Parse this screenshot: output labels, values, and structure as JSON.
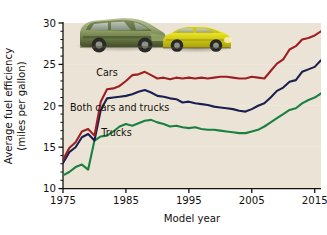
{
  "chart_data": {
    "type": "line",
    "title": "",
    "xlabel": "Model year",
    "ylabel": "Average fuel efficiency (miles per gallon)",
    "ylabel_line1": "Average fuel efficiency",
    "ylabel_line2": "(miles per gallon)",
    "xlim": [
      1975,
      2016
    ],
    "ylim": [
      10,
      30
    ],
    "xticks": [
      1975,
      1985,
      1995,
      2005,
      2015
    ],
    "xtick_labels": [
      "1975",
      "1985",
      "1995",
      "2005",
      "2015"
    ],
    "yticks": [
      10,
      15,
      20,
      25,
      30
    ],
    "ytick_labels": [
      "10",
      "15",
      "20",
      "25",
      "30"
    ],
    "minor_ytick_step": 1,
    "grid": false,
    "legend_position": "inline-annotations",
    "plot_background": "#ebe4d6",
    "x": [
      1975,
      1976,
      1977,
      1978,
      1979,
      1980,
      1981,
      1982,
      1983,
      1984,
      1985,
      1986,
      1987,
      1988,
      1989,
      1990,
      1991,
      1992,
      1993,
      1994,
      1995,
      1996,
      1997,
      1998,
      1999,
      2000,
      2001,
      2002,
      2003,
      2004,
      2005,
      2006,
      2007,
      2008,
      2009,
      2010,
      2011,
      2012,
      2013,
      2014,
      2015,
      2016
    ],
    "series": [
      {
        "name": "Cars",
        "color": "#9e1f22",
        "label": "Cars",
        "label_x": 1982.0,
        "label_y": 23.6,
        "values": [
          13.5,
          14.9,
          15.6,
          16.9,
          17.2,
          16.4,
          20.5,
          22.0,
          22.1,
          22.4,
          23.0,
          23.7,
          23.8,
          24.1,
          23.7,
          23.3,
          23.4,
          23.2,
          23.4,
          23.3,
          23.4,
          23.3,
          23.4,
          23.3,
          23.4,
          23.5,
          23.5,
          23.4,
          23.3,
          23.3,
          23.5,
          23.4,
          23.3,
          24.2,
          25.1,
          25.6,
          26.8,
          27.2,
          28.0,
          28.2,
          28.5,
          29.0
        ]
      },
      {
        "name": "Both cars and trucks",
        "color": "#1a1f50",
        "label": "Both cars and trucks",
        "label_x": 1984.0,
        "label_y": 19.4,
        "values": [
          13.1,
          14.4,
          15.0,
          16.2,
          16.6,
          15.8,
          19.5,
          20.9,
          21.0,
          21.1,
          21.2,
          21.4,
          21.7,
          21.9,
          21.6,
          21.2,
          21.1,
          20.9,
          20.8,
          20.4,
          20.5,
          20.3,
          20.2,
          20.1,
          19.9,
          19.8,
          19.7,
          19.6,
          19.4,
          19.3,
          19.6,
          20.0,
          20.3,
          21.0,
          21.8,
          22.2,
          22.9,
          23.1,
          24.1,
          24.4,
          24.7,
          25.5
        ]
      },
      {
        "name": "Trucks",
        "color": "#1a8040",
        "label": "Trucks",
        "label_x": 1983.5,
        "label_y": 16.3,
        "values": [
          11.6,
          12.0,
          12.6,
          12.9,
          12.3,
          15.8,
          16.3,
          16.4,
          16.9,
          17.5,
          17.8,
          17.6,
          17.9,
          18.2,
          18.3,
          18.0,
          17.8,
          17.5,
          17.6,
          17.4,
          17.3,
          17.4,
          17.2,
          17.1,
          17.1,
          17.0,
          16.9,
          16.8,
          16.7,
          16.7,
          16.9,
          17.1,
          17.5,
          18.0,
          18.5,
          19.0,
          19.5,
          19.7,
          20.3,
          20.7,
          21.0,
          21.5
        ]
      }
    ],
    "photos": [
      {
        "name": "suv-photo",
        "description": "green SUV",
        "color": "#6f7d4b"
      },
      {
        "name": "sedan-photo",
        "description": "yellow sedan",
        "color": "#ddd719"
      }
    ]
  }
}
